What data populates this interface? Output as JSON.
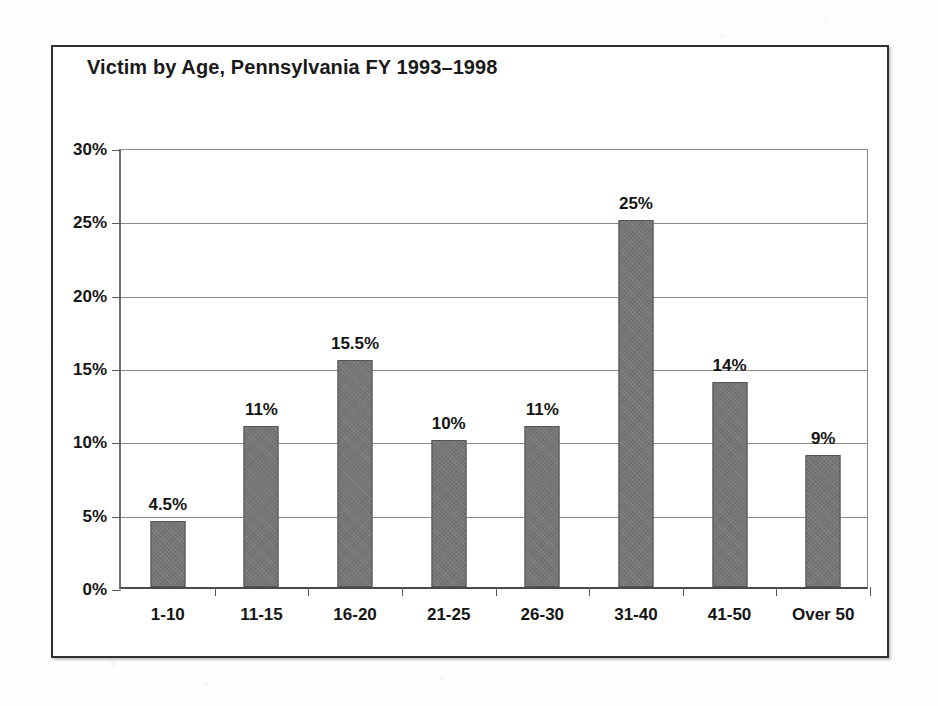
{
  "chart_data": {
    "type": "bar",
    "title": "Victim by Age, Pennsylvania FY 1993–1998",
    "xlabel": "",
    "ylabel": "",
    "categories": [
      "1-10",
      "11-15",
      "16-20",
      "21-25",
      "26-30",
      "31-40",
      "41-50",
      "Over 50"
    ],
    "values": [
      4.5,
      11,
      15.5,
      10,
      11,
      25,
      14,
      9
    ],
    "value_labels": [
      "4.5%",
      "11%",
      "15.5%",
      "10%",
      "11%",
      "25%",
      "14%",
      "9%"
    ],
    "ylim": [
      0,
      30
    ],
    "ytick_values": [
      0,
      5,
      10,
      15,
      20,
      25,
      30
    ],
    "ytick_labels": [
      "0%",
      "5%",
      "10%",
      "15%",
      "20%",
      "25%",
      "30%"
    ],
    "grid": true,
    "legend": "none",
    "series_color": "#757575",
    "bar_border_color": "#555555",
    "axis_color": "#5a5a5a",
    "frame_color": "#303030",
    "text_color": "#141414"
  }
}
